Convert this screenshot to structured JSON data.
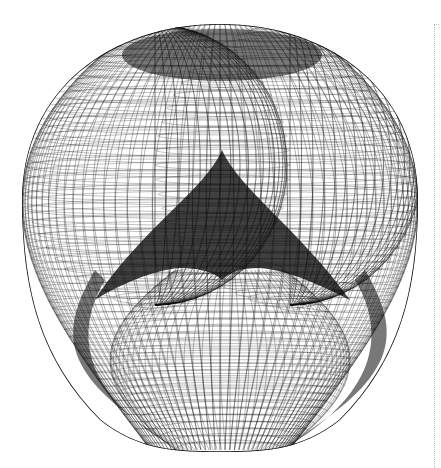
{
  "figure": {
    "background": "#ffffff",
    "stroke_color": "#111111",
    "center": [
      220,
      237
    ],
    "outer_outline": {
      "top": 24,
      "bottom": 450,
      "left": 22,
      "right": 418
    },
    "inner_bowl": {
      "cx": 230,
      "top": 270,
      "bottom": 450,
      "rx": 120
    },
    "upper_lobes": [
      {
        "name": "left",
        "cx": 155,
        "cy": 165,
        "rx": 135,
        "ry": 140
      },
      {
        "name": "right",
        "cx": 290,
        "cy": 165,
        "rx": 135,
        "ry": 140
      }
    ],
    "mesh": {
      "meridians": 90,
      "parallels": 60
    }
  },
  "divider": {
    "x": 434,
    "top": 24,
    "style": "dotted",
    "color": "#b8b8b8"
  }
}
